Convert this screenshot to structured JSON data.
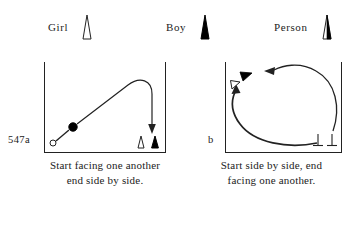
{
  "figure": {
    "number": "547a",
    "panel_b_id": "b",
    "legend": [
      {
        "label": "Girl",
        "glyph": "hollow-triangle-icon"
      },
      {
        "label": "Boy",
        "glyph": "filled-triangle-icon"
      },
      {
        "label": "Person",
        "glyph": "half-filled-triangle-icon"
      }
    ],
    "panels": [
      {
        "id": "547a",
        "caption_line1": "Start facing one another",
        "caption_line2": "end side by side.",
        "start_markers": [
          "hollow-circle-girl",
          "filled-circle-boy"
        ],
        "end_markers": [
          "hollow-triangle-girl",
          "filled-triangle-boy"
        ],
        "path_description": "arc from lower-left up to upper-right then down with downward arrowhead"
      },
      {
        "id": "b",
        "caption_line1": "Start side by side, end",
        "caption_line2": "facing one another.",
        "start_markers": [
          "tee-mark-girl",
          "tee-mark-boy"
        ],
        "end_markers": [
          "hollow-arrowhead-girl",
          "filled-arrowhead-boy"
        ],
        "path_description": "two curved paths from lower-right sweeping left and up to arrowheads at upper-left"
      }
    ],
    "colors": {
      "ink": "#222222",
      "fill_solid": "#000000",
      "fill_hollow": "#ffffff",
      "background": "#ffffff"
    }
  }
}
